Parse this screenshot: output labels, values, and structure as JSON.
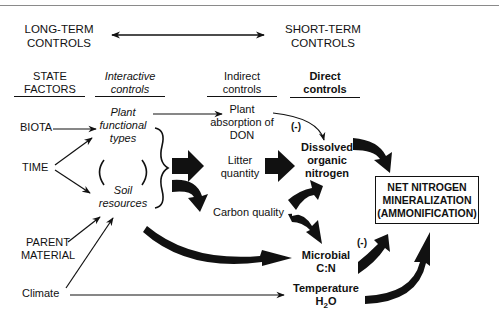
{
  "header": {
    "long_term": [
      "LONG-TERM",
      "CONTROLS"
    ],
    "short_term": [
      "SHORT-TERM",
      "CONTROLS"
    ]
  },
  "columns": {
    "state_factors": [
      "STATE",
      "FACTORS"
    ],
    "interactive": [
      "Interactive",
      "controls"
    ],
    "indirect": [
      "Indirect",
      "controls"
    ],
    "direct": [
      "Direct",
      "controls"
    ]
  },
  "state_factors": {
    "biota": "BIOTA",
    "time": "TIME",
    "parent_material": [
      "PARENT",
      "MATERIAL"
    ],
    "climate": "Climate"
  },
  "interactive": {
    "plant": [
      "Plant",
      "functional",
      "types"
    ],
    "soil": [
      "Soil",
      "resources"
    ]
  },
  "indirect": {
    "plant_absorption": [
      "Plant",
      "absorption of",
      "DON"
    ],
    "litter": [
      "Litter",
      "quantity"
    ],
    "carbon": "Carbon quality"
  },
  "direct": {
    "don": [
      "Dissolved",
      "organic",
      "nitrogen"
    ],
    "microbial": [
      "Microbial",
      "C:N"
    ],
    "temperature": "Temperature",
    "h2o_main": "H",
    "h2o_sub": "2",
    "h2o_end": "O"
  },
  "negative_labels": {
    "don": "(-)",
    "microbial": "(-)"
  },
  "outcome": [
    "NET NITROGEN",
    "MINERALIZATION",
    "(AMMONIFICATION)"
  ]
}
